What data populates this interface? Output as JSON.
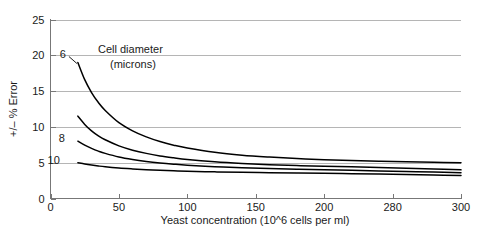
{
  "chart_data": {
    "type": "line",
    "title": "",
    "xlabel": "Yeast concentration (10^6 cells per ml)",
    "ylabel": "+/– % Error",
    "xlim": [
      0,
      300
    ],
    "ylim": [
      0,
      25
    ],
    "grid": "horizontal",
    "legend": "inline-curve-labels",
    "x_ticks": [
      {
        "value": 0,
        "label": "0"
      },
      {
        "value": 50,
        "label": "50"
      },
      {
        "value": 100,
        "label": "100"
      },
      {
        "value": 150,
        "label": "150"
      },
      {
        "value": 200,
        "label": "200"
      },
      {
        "value": 250,
        "label": "280"
      },
      {
        "value": 300,
        "label": "300"
      }
    ],
    "y_ticks": [
      {
        "value": 0,
        "label": "0"
      },
      {
        "value": 5,
        "label": "5"
      },
      {
        "value": 10,
        "label": "10"
      },
      {
        "value": 15,
        "label": "15"
      },
      {
        "value": 20,
        "label": "20"
      },
      {
        "value": 25,
        "label": "25"
      }
    ],
    "annotations": [
      {
        "name": "cell-diameter-annotation",
        "line1": "Cell diameter",
        "line2": "(microns)"
      }
    ],
    "x": [
      20,
      25,
      30,
      35,
      40,
      50,
      60,
      70,
      80,
      90,
      100,
      120,
      140,
      160,
      180,
      200,
      220,
      240,
      260,
      280,
      300
    ],
    "series": [
      {
        "name": "6",
        "label": "6",
        "values": [
          19.0,
          16.6,
          14.8,
          13.4,
          12.3,
          10.6,
          9.45,
          8.6,
          7.95,
          7.45,
          7.05,
          6.45,
          6.05,
          5.78,
          5.57,
          5.42,
          5.3,
          5.2,
          5.12,
          5.05,
          5.0
        ]
      },
      {
        "name": "8",
        "label": "",
        "values": [
          11.5,
          10.35,
          9.45,
          8.75,
          8.2,
          7.35,
          6.75,
          6.3,
          5.95,
          5.68,
          5.45,
          5.13,
          4.9,
          4.73,
          4.6,
          4.5,
          4.42,
          4.32,
          4.22,
          4.12,
          4.0
        ]
      },
      {
        "name": "8b",
        "label": "8",
        "values": [
          8.0,
          7.45,
          7.0,
          6.62,
          6.3,
          5.8,
          5.45,
          5.18,
          4.97,
          4.8,
          4.66,
          4.45,
          4.3,
          4.18,
          4.08,
          4.0,
          3.93,
          3.85,
          3.77,
          3.69,
          3.6
        ]
      },
      {
        "name": "10",
        "label": "10",
        "values": [
          5.0,
          4.82,
          4.67,
          4.54,
          4.43,
          4.26,
          4.13,
          4.02,
          3.94,
          3.87,
          3.81,
          3.72,
          3.65,
          3.6,
          3.55,
          3.51,
          3.46,
          3.41,
          3.35,
          3.28,
          3.2
        ]
      }
    ]
  },
  "colors": {
    "curve": "#000000",
    "gridline": "#b5b5b5",
    "axis": "#777777",
    "text": "#1a1a1a",
    "background": "#ffffff"
  }
}
